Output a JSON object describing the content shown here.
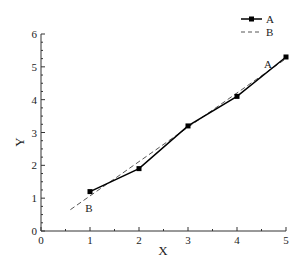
{
  "chart_data": {
    "type": "line",
    "title": "",
    "xlabel": "X",
    "ylabel": "Y",
    "xlim": [
      0,
      5
    ],
    "ylim": [
      0,
      6
    ],
    "x_ticks": [
      0,
      1,
      2,
      3,
      4,
      5
    ],
    "y_ticks": [
      0,
      1,
      2,
      3,
      4,
      5,
      6
    ],
    "x_tick_labels": [
      "0",
      "1",
      "2",
      "3",
      "4",
      "5"
    ],
    "y_tick_labels": [
      "0",
      "1",
      "2",
      "3",
      "4",
      "5",
      "6"
    ],
    "grid": false,
    "legend_position": "upper right",
    "series": [
      {
        "name": "A",
        "style": "solid line with square markers",
        "color": "#000000",
        "x": [
          1,
          2,
          3,
          4,
          5
        ],
        "y": [
          1.2,
          1.9,
          3.2,
          4.1,
          5.3
        ]
      },
      {
        "name": "B",
        "style": "dashed line",
        "color": "#555555",
        "x": [
          0.6,
          5
        ],
        "y": [
          0.65,
          5.25
        ]
      }
    ],
    "annotations": [
      {
        "text": "A",
        "x": 4.63,
        "y": 5.1
      },
      {
        "text": "B",
        "x": 0.98,
        "y": 0.7
      }
    ]
  }
}
